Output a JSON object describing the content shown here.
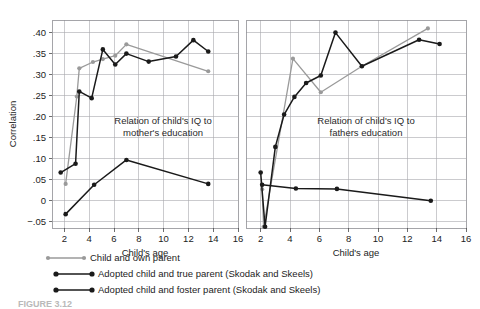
{
  "figure": {
    "caption": "FIGURE 3.12",
    "axis": {
      "ylabel": "Correlation",
      "xlabel": "Child's age",
      "ytick_labels": [
        ".40",
        ".35",
        ".30",
        ".25",
        ".20",
        ".15",
        ".10",
        ".05",
        "0",
        "−.05"
      ],
      "ytick_values": [
        0.4,
        0.35,
        0.3,
        0.25,
        0.2,
        0.15,
        0.1,
        0.05,
        0.0,
        -0.05
      ],
      "xtick_labels": [
        "2",
        "4",
        "6",
        "8",
        "10",
        "12",
        "14",
        "16"
      ],
      "xtick_values": [
        2,
        4,
        6,
        8,
        10,
        12,
        14,
        16
      ],
      "xlim": [
        1,
        16
      ],
      "ylim": [
        -0.065,
        0.43
      ],
      "grid": true
    },
    "colors": {
      "own_parent": "#9a9a9a",
      "true_parent": "#1a1a1a",
      "foster_parent": "#1a1a1a",
      "gridline": "#a9a9ad",
      "frame": "#8e8e93"
    },
    "legend": {
      "position": "below-plot-left",
      "entries": [
        {
          "label": "Child and own parent",
          "color": "#9a9a9a",
          "marker": "circle"
        },
        {
          "label": "Adopted child and true parent (Skodak and Skeels)",
          "color": "#1a1a1a",
          "marker": "circle"
        },
        {
          "label": "Adopted child and foster parent (Skodak and Skeels)",
          "color": "#1a1a1a",
          "marker": "circle"
        }
      ]
    }
  },
  "chart_data": [
    {
      "type": "line",
      "panel": "left",
      "title": "",
      "annotation": [
        "Relation of child's IQ to",
        "mother's education"
      ],
      "xlabel": "Child's age",
      "ylabel": "Correlation",
      "xlim": [
        1,
        16
      ],
      "ylim": [
        -0.065,
        0.43
      ],
      "grid": true,
      "series": [
        {
          "name": "Child and own parent",
          "color": "#9a9a9a",
          "x": [
            2.1,
            3.0,
            3.2,
            4.3,
            5.1,
            6.1,
            7.0,
            13.6
          ],
          "y": [
            0.04,
            0.248,
            0.315,
            0.33,
            0.337,
            0.345,
            0.372,
            0.308
          ]
        },
        {
          "name": "Adopted child and true parent (Skodak and Skeels)",
          "color": "#1a1a1a",
          "x": [
            1.7,
            2.9,
            3.2,
            4.2,
            5.1,
            6.1,
            7.0,
            8.8,
            11.0,
            12.4,
            13.6
          ],
          "y": [
            0.067,
            0.088,
            0.26,
            0.244,
            0.36,
            0.324,
            0.35,
            0.331,
            0.343,
            0.382,
            0.355
          ]
        },
        {
          "name": "Adopted child and foster parent (Skodak and Skeels)",
          "color": "#1a1a1a",
          "x": [
            2.1,
            4.4,
            7.0,
            13.6
          ],
          "y": [
            -0.032,
            0.038,
            0.097,
            0.04
          ]
        }
      ]
    },
    {
      "type": "line",
      "panel": "right",
      "title": "",
      "annotation": [
        "Relation of child's IQ to",
        "fathers education"
      ],
      "xlabel": "Child's age",
      "ylabel": "Correlation",
      "xlim": [
        1,
        16
      ],
      "ylim": [
        -0.065,
        0.43
      ],
      "grid": true,
      "series": [
        {
          "name": "Child and own parent",
          "color": "#9a9a9a",
          "x": [
            2.1,
            2.2,
            4.2,
            6.1,
            8.9,
            13.4
          ],
          "y": [
            0.027,
            -0.062,
            0.338,
            0.258,
            0.32,
            0.41
          ]
        },
        {
          "name": "Adopted child and true parent (Skodak and Skeels)",
          "color": "#1a1a1a",
          "x": [
            2.0,
            2.3,
            3.0,
            3.6,
            4.3,
            5.1,
            6.1,
            7.1,
            8.9,
            12.8,
            14.2
          ],
          "y": [
            0.067,
            -0.062,
            0.128,
            0.205,
            0.247,
            0.28,
            0.298,
            0.4,
            0.32,
            0.383,
            0.373
          ]
        },
        {
          "name": "Adopted child and foster parent (Skodak and Skeels)",
          "color": "#1a1a1a",
          "x": [
            2.1,
            4.4,
            7.2,
            13.6
          ],
          "y": [
            0.038,
            0.029,
            0.028,
            0.0
          ]
        }
      ]
    }
  ]
}
